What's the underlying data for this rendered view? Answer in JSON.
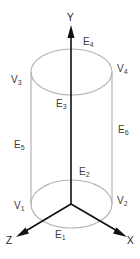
{
  "diagram": {
    "axes": {
      "y": {
        "label": "Y"
      },
      "x": {
        "label": "X"
      },
      "z": {
        "label": "Z"
      }
    },
    "vertices": [
      {
        "id": "V1",
        "base": "V",
        "sub": "1"
      },
      {
        "id": "V2",
        "base": "V",
        "sub": "2"
      },
      {
        "id": "V3",
        "base": "V",
        "sub": "3"
      },
      {
        "id": "V4",
        "base": "V",
        "sub": "4"
      }
    ],
    "edges": [
      {
        "id": "E1",
        "base": "E",
        "sub": "1"
      },
      {
        "id": "E2",
        "base": "E",
        "sub": "2"
      },
      {
        "id": "E3",
        "base": "E",
        "sub": "3"
      },
      {
        "id": "E4",
        "base": "E",
        "sub": "4"
      },
      {
        "id": "E5",
        "base": "E",
        "sub": "5"
      },
      {
        "id": "E6",
        "base": "E",
        "sub": "6"
      }
    ],
    "colors": {
      "cylinder": "#b4b4b4",
      "axes": "#111111",
      "labels": "#3a3a3a"
    }
  }
}
